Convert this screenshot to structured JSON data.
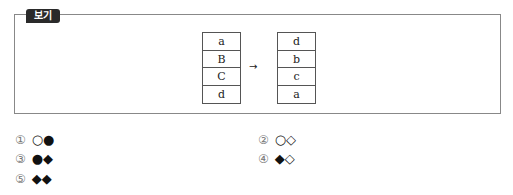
{
  "box": {
    "tag_label": "보기"
  },
  "before_stack": {
    "cells": [
      "a",
      "B",
      "C",
      "d"
    ]
  },
  "arrow": "→",
  "after_stack": {
    "cells": [
      "d",
      "b",
      "c",
      "a"
    ]
  },
  "options": [
    {
      "num": "①",
      "symbols": "○●"
    },
    {
      "num": "②",
      "symbols": "○◇"
    },
    {
      "num": "③",
      "symbols": "●◆"
    },
    {
      "num": "④",
      "symbols": "◆◇"
    },
    {
      "num": "⑤",
      "symbols": "◆◆"
    }
  ]
}
